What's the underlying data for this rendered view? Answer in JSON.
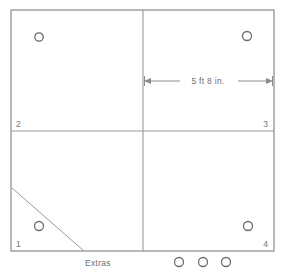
{
  "diagram": {
    "frame": {
      "x": 11,
      "y": 10,
      "width": 263,
      "height": 241,
      "stroke_color": "#8a8a8a"
    },
    "dividers": {
      "vertical_x": 143,
      "horizontal_y": 131,
      "stroke_color": "#9a9a9a"
    },
    "quadrants": [
      {
        "id": "quadrant-2",
        "label": "2",
        "label_x": 16,
        "label_y": 127,
        "anchor": "start"
      },
      {
        "id": "quadrant-3",
        "label": "3",
        "label_x": 268,
        "label_y": 127,
        "anchor": "end"
      },
      {
        "id": "quadrant-1",
        "label": "1",
        "label_x": 16,
        "label_y": 247,
        "anchor": "start"
      },
      {
        "id": "quadrant-4",
        "label": "4",
        "label_x": 268,
        "label_y": 247,
        "anchor": "end"
      }
    ],
    "holes": [
      {
        "id": "hole-quadrant-2",
        "cx": 39,
        "cy": 37,
        "r": 4.2
      },
      {
        "id": "hole-quadrant-3",
        "cx": 247,
        "cy": 36,
        "r": 4.5
      },
      {
        "id": "hole-quadrant-1",
        "cx": 39,
        "cy": 226,
        "r": 4.5
      },
      {
        "id": "hole-quadrant-4",
        "cx": 248,
        "cy": 226,
        "r": 4.5
      }
    ],
    "diagonal": {
      "id": "corner-cut-line",
      "x1": 12,
      "y1": 188,
      "x2": 84,
      "y2": 251
    },
    "dimension": {
      "label": "5 ft 8 in.",
      "value": "5 ft 8 in.",
      "x1": 144,
      "x2": 273,
      "y": 81,
      "label_x": 208,
      "label_y": 78
    },
    "extras": {
      "label": "Extras",
      "label_x": 85,
      "label_y": 266,
      "count": 3,
      "circles": [
        {
          "id": "extra-circle-1",
          "cx": 179,
          "cy": 262,
          "r": 4.5
        },
        {
          "id": "extra-circle-2",
          "cx": 203,
          "cy": 262,
          "r": 4.5
        },
        {
          "id": "extra-circle-3",
          "cx": 226,
          "cy": 262,
          "r": 4.5
        }
      ]
    },
    "colors": {
      "frame": "#8a8a8a",
      "divider": "#9a9a9a",
      "hole_stroke": "#6b6b6b",
      "text": "#6f6f6f",
      "background": "#ffffff"
    }
  }
}
